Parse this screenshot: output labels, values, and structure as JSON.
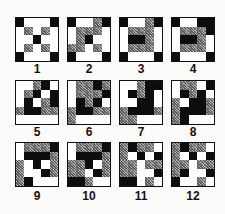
{
  "figure": {
    "legend": {
      "W": "white",
      "G": "gray-hatched",
      "B": "black"
    },
    "colors": {
      "white": "#ffffff",
      "gray": "#8a8a8a",
      "black": "#0d0d0d",
      "border": "#111111"
    },
    "patterns": [
      {
        "label": "1",
        "cells": [
          "BWWWB",
          "WGWGW",
          "WWBWW",
          "WGWGW",
          "BWWWB"
        ]
      },
      {
        "label": "2",
        "cells": [
          "BWWGB",
          "WGGGW",
          "WGBWW",
          "GGWGW",
          "BWWWB"
        ]
      },
      {
        "label": "3",
        "cells": [
          "BWWGB",
          "WGGGW",
          "WBBGW",
          "WGGGW",
          "BWWWB"
        ]
      },
      {
        "label": "4",
        "cells": [
          "BWWBB",
          "WGGGB",
          "WBBGW",
          "WGGGW",
          "BWWWB"
        ]
      },
      {
        "label": "5",
        "cells": [
          "WWGBW",
          "WGBWB",
          "WBWGB",
          "GBBGG",
          "WWWWW"
        ]
      },
      {
        "label": "6",
        "cells": [
          "WGGBG",
          "WGGGB",
          "WBGBW",
          "GBBGG",
          "GWWWW"
        ]
      },
      {
        "label": "7",
        "cells": [
          "WWGBB",
          "WBGBW",
          "WWBBW",
          "GBBBG",
          "GGWWW"
        ]
      },
      {
        "label": "8",
        "cells": [
          "WGGWB",
          "WBGBW",
          "GWBBG",
          "GBBBG",
          "GBWWW"
        ]
      },
      {
        "label": "9",
        "cells": [
          "WGGGB",
          "WBBBG",
          "GWBWG",
          "GWWBG",
          "GBWWW"
        ]
      },
      {
        "label": "10",
        "cells": [
          "WGGGB",
          "WBBBG",
          "GGBWG",
          "GGWBG",
          "BBGWW"
        ]
      },
      {
        "label": "11",
        "cells": [
          "GBGGW",
          "GWBWB",
          "GGWGG",
          "GGWWB",
          "BBWGW"
        ]
      },
      {
        "label": "12",
        "cells": [
          "GBGGW",
          "GWBWB",
          "GGWGG",
          "GBWWB",
          "BWWGW"
        ]
      }
    ]
  }
}
